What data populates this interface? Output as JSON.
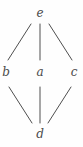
{
  "figure": {
    "kind": "hasse-diagram",
    "width": 83,
    "height": 147,
    "background_color": "#fefefe",
    "edge_color": "#4f4f4f",
    "label_color": "#4a4a4a",
    "edge_width": 1
  },
  "nodes": [
    {
      "id": "e",
      "label": "e",
      "x": 40,
      "y": 13,
      "level": "top"
    },
    {
      "id": "b",
      "label": "b",
      "x": 6,
      "y": 72,
      "level": "middle"
    },
    {
      "id": "a",
      "label": "a",
      "x": 40,
      "y": 72,
      "level": "middle"
    },
    {
      "id": "c",
      "label": "c",
      "x": 74,
      "y": 72,
      "level": "middle"
    },
    {
      "id": "d",
      "label": "d",
      "x": 40,
      "y": 134,
      "level": "bottom"
    }
  ],
  "edges": [
    {
      "id": "e-b",
      "from": "e",
      "to": "b",
      "x1": 31,
      "y1": 24,
      "x2": 8,
      "y2": 60
    },
    {
      "id": "e-a",
      "from": "e",
      "to": "a",
      "x1": 40,
      "y1": 24,
      "x2": 40,
      "y2": 60
    },
    {
      "id": "e-c",
      "from": "e",
      "to": "c",
      "x1": 49,
      "y1": 24,
      "x2": 72,
      "y2": 60
    },
    {
      "id": "b-d",
      "from": "b",
      "to": "d",
      "x1": 9,
      "y1": 87,
      "x2": 32,
      "y2": 123
    },
    {
      "id": "a-d",
      "from": "a",
      "to": "d",
      "x1": 40,
      "y1": 87,
      "x2": 40,
      "y2": 123
    },
    {
      "id": "c-d",
      "from": "c",
      "to": "d",
      "x1": 71,
      "y1": 87,
      "x2": 48,
      "y2": 123
    }
  ]
}
